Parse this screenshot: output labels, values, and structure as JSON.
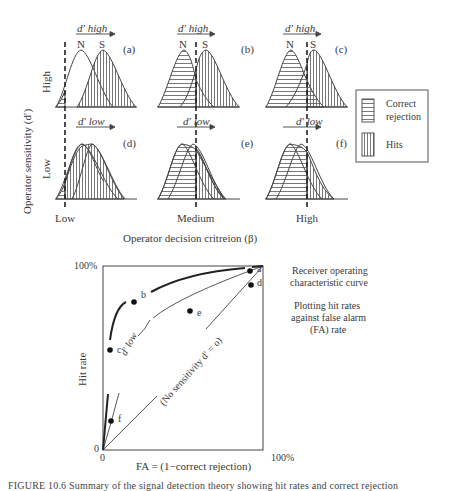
{
  "top_panel": {
    "y_axis_label": "Operator sensitivity (d′)",
    "row_labels": {
      "high": "High",
      "low": "Low"
    },
    "x_axis_label": "Operator decision critreion (β)",
    "criterion_labels": {
      "low": "Low",
      "medium": "Medium",
      "high": "High"
    },
    "panels": [
      {
        "id": "a",
        "tag": "(a)",
        "dprime": "d′ high",
        "noise_label": "N",
        "signal_label": "S"
      },
      {
        "id": "b",
        "tag": "(b)",
        "dprime": "d′ high",
        "noise_label": "N",
        "signal_label": "S"
      },
      {
        "id": "c",
        "tag": "(c)",
        "dprime": "d′ high",
        "noise_label": "N",
        "signal_label": "S"
      },
      {
        "id": "d",
        "tag": "(d)",
        "dprime": "d′ low"
      },
      {
        "id": "e",
        "tag": "(e)",
        "dprime": "d′ low"
      },
      {
        "id": "f",
        "tag": "(f)",
        "dprime": "d′ low"
      }
    ],
    "legend": {
      "items": [
        {
          "pattern": "horizontal-hatch",
          "label_line1": "Correct",
          "label_line2": "rejection"
        },
        {
          "pattern": "vertical-hatch",
          "label_line1": "Hits",
          "label_line2": ""
        }
      ]
    }
  },
  "roc_panel": {
    "y_axis_label": "Hit rate",
    "y_top_tick": "100%",
    "y_origin_tick": "0",
    "x_origin_tick": "0",
    "x_right_tick": "100%",
    "x_axis_label": "FA = (1−correct rejection)",
    "curve_labels": {
      "low": "d′ low",
      "none": "(No sensitivity d′ = o)"
    },
    "points": [
      "a",
      "b",
      "c",
      "d",
      "e",
      "f"
    ],
    "side_title_line1": "Receiver operating",
    "side_title_line2": "characteristic curve",
    "side_note_line1": "Plotting hit rates",
    "side_note_line2": "against false alarm",
    "side_note_line3": "(FA) rate"
  },
  "caption": "FIGURE 10.6 Summary of the signal detection theory showing hit rates and correct rejection"
}
